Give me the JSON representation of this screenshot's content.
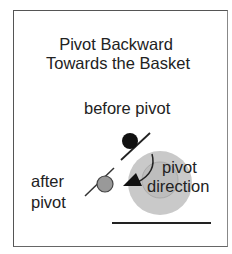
{
  "title": {
    "line1": "Pivot Backward",
    "line2": "Towards the Basket"
  },
  "labels": {
    "before": "before pivot",
    "after_line1": "after",
    "after_line2": "pivot",
    "direction_line1": "pivot",
    "direction_line2": "direction"
  },
  "colors": {
    "before_player": "#111111",
    "after_player": "#999999",
    "basket_outer": "#c8c8c8",
    "basket_inner": "#bcbcbc",
    "line": "#222222"
  }
}
